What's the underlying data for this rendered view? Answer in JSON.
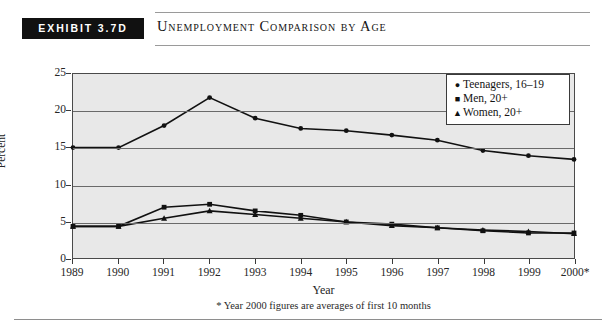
{
  "exhibit": {
    "badge_label": "EXHIBIT 3.7D",
    "title": "Unemployment Comparison by Age"
  },
  "footnote": "* Year 2000 figures are averages of first 10 months",
  "legend": {
    "items": [
      {
        "marker": "circle",
        "glyph": "●",
        "label": "Teenagers, 16–19"
      },
      {
        "marker": "square",
        "glyph": "■",
        "label": "Men, 20+"
      },
      {
        "marker": "triangle",
        "glyph": "▲",
        "label": "Women, 20+"
      }
    ]
  },
  "axis": {
    "y_ticks": [
      "0",
      "5",
      "10",
      "15",
      "20",
      "25"
    ],
    "x_ticks": [
      "1989",
      "1990",
      "1991",
      "1992",
      "1993",
      "1994",
      "1995",
      "1996",
      "1997",
      "1998",
      "1999",
      "2000*"
    ]
  },
  "colors": {
    "plot_background": "#e8e8e8",
    "frame": "#4a4a4a",
    "gridline": "#6a6a6a",
    "series": "#111111",
    "badge_background": "#111111",
    "badge_text": "#ffffff"
  },
  "chart_data": {
    "type": "line",
    "title": "Unemployment Comparison by Age",
    "xlabel": "Year",
    "ylabel": "Percent",
    "ylim": [
      0,
      25
    ],
    "ytick_interval": 5,
    "grid": true,
    "legend_position": "top-right",
    "annotation": "* Year 2000 figures are averages of first 10 months",
    "categories": [
      "1989",
      "1990",
      "1991",
      "1992",
      "1993",
      "1994",
      "1995",
      "1996",
      "1997",
      "1998",
      "1999",
      "2000*"
    ],
    "series": [
      {
        "name": "Teenagers, 16–19",
        "marker": "circle",
        "values": [
          15.0,
          15.0,
          18.0,
          21.8,
          19.0,
          17.6,
          17.3,
          16.7,
          16.0,
          14.6,
          13.9,
          13.4
        ]
      },
      {
        "name": "Men, 20+",
        "marker": "square",
        "values": [
          4.3,
          4.3,
          6.9,
          7.3,
          6.4,
          5.8,
          4.9,
          4.6,
          4.1,
          3.7,
          3.4,
          3.4
        ]
      },
      {
        "name": "Women, 20+",
        "marker": "triangle",
        "values": [
          4.3,
          4.3,
          5.4,
          6.4,
          5.9,
          5.4,
          4.9,
          4.4,
          4.1,
          3.8,
          3.6,
          3.3
        ]
      }
    ]
  }
}
